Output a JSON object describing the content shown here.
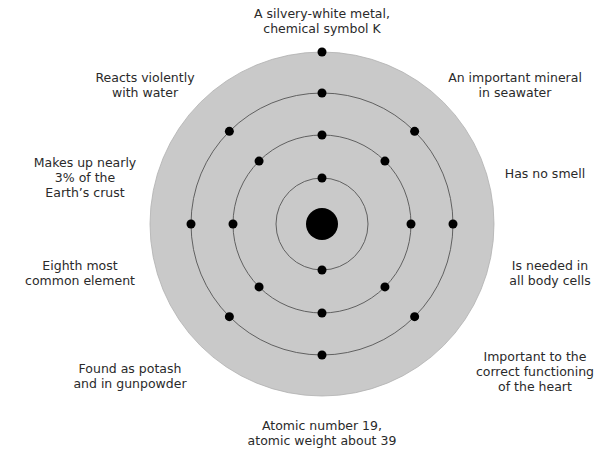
{
  "diagram": {
    "center": [
      322,
      224
    ],
    "disc": {
      "r": 172,
      "color": "#c9c9c9"
    },
    "nucleus": {
      "r": 16,
      "color": "#000000"
    },
    "shells": [
      {
        "r": 46,
        "electrons": 2
      },
      {
        "r": 89,
        "electrons": 8
      },
      {
        "r": 131,
        "electrons": 8
      },
      {
        "r": 172,
        "electrons": 1
      }
    ],
    "electron_color": "#000000",
    "orbit_color": "#555555"
  },
  "labels": {
    "top": "A silvery-white metal,\nchemical symbol K",
    "top_left": "Reacts violently\nwith water",
    "top_right": "An important mineral\nin seawater",
    "mid_left_upper": "Makes up nearly\n3% of the\nEarth’s crust",
    "mid_right_upper": "Has no smell",
    "mid_left_lower": "Eighth most\ncommon element",
    "mid_right_lower": "Is needed in\nall body cells",
    "bottom_left": "Found as potash\nand in gunpowder",
    "bottom_right": "Important to the\ncorrect functioning\nof the heart",
    "bottom": "Atomic number 19,\natomic weight about 39"
  }
}
